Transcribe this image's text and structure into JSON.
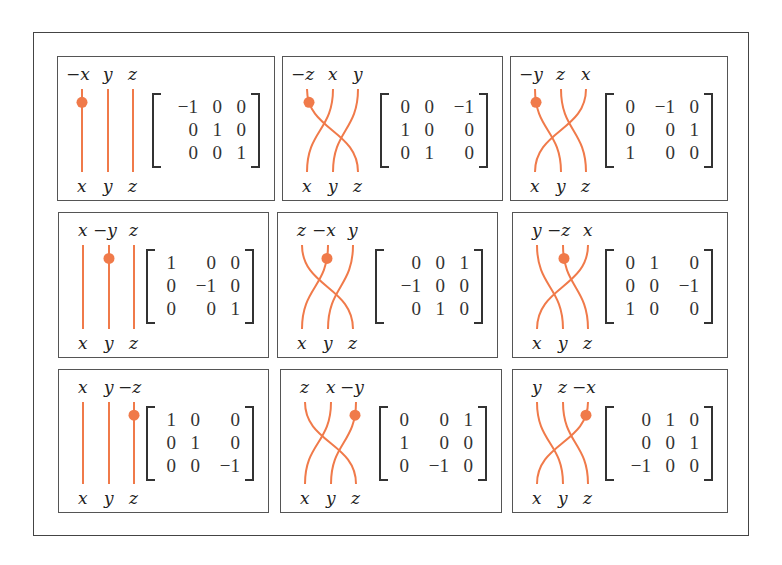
{
  "figure": {
    "strand_color": "#f07a4a",
    "marker_color": "#f07a4a",
    "bottom_labels": [
      "x",
      "y",
      "z"
    ],
    "panels": [
      {
        "top_labels": [
          "−x",
          "y",
          "z"
        ],
        "matrix": [
          [
            "−1",
            "0",
            "0"
          ],
          [
            "0",
            "1",
            "0"
          ],
          [
            "0",
            "0",
            "1"
          ]
        ]
      },
      {
        "top_labels": [
          "−z",
          "x",
          "y"
        ],
        "matrix": [
          [
            "0",
            "0",
            "−1"
          ],
          [
            "1",
            "0",
            "0"
          ],
          [
            "0",
            "1",
            "0"
          ]
        ]
      },
      {
        "top_labels": [
          "−y",
          "z",
          "x"
        ],
        "matrix": [
          [
            "0",
            "−1",
            "0"
          ],
          [
            "0",
            "0",
            "1"
          ],
          [
            "1",
            "0",
            "0"
          ]
        ]
      },
      {
        "top_labels": [
          "x",
          "−y",
          "z"
        ],
        "matrix": [
          [
            "1",
            "0",
            "0"
          ],
          [
            "0",
            "−1",
            "0"
          ],
          [
            "0",
            "0",
            "1"
          ]
        ]
      },
      {
        "top_labels": [
          "z",
          "−x",
          "y"
        ],
        "matrix": [
          [
            "0",
            "0",
            "1"
          ],
          [
            "−1",
            "0",
            "0"
          ],
          [
            "0",
            "1",
            "0"
          ]
        ]
      },
      {
        "top_labels": [
          "y",
          "−z",
          "x"
        ],
        "matrix": [
          [
            "0",
            "1",
            "0"
          ],
          [
            "0",
            "0",
            "−1"
          ],
          [
            "1",
            "0",
            "0"
          ]
        ]
      },
      {
        "top_labels": [
          "x",
          "y",
          "−z"
        ],
        "matrix": [
          [
            "1",
            "0",
            "0"
          ],
          [
            "0",
            "1",
            "0"
          ],
          [
            "0",
            "0",
            "−1"
          ]
        ]
      },
      {
        "top_labels": [
          "z",
          "x",
          "−y"
        ],
        "matrix": [
          [
            "0",
            "0",
            "1"
          ],
          [
            "1",
            "0",
            "0"
          ],
          [
            "0",
            "−1",
            "0"
          ]
        ]
      },
      {
        "top_labels": [
          "y",
          "z",
          "−x"
        ],
        "matrix": [
          [
            "0",
            "1",
            "0"
          ],
          [
            "0",
            "0",
            "1"
          ],
          [
            "−1",
            "0",
            "0"
          ]
        ]
      }
    ]
  }
}
